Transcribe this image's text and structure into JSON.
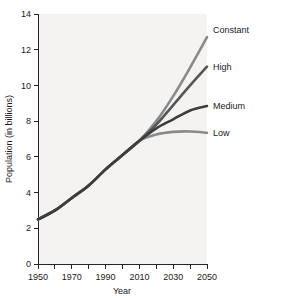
{
  "chart_data": {
    "type": "line",
    "title": "",
    "xlabel": "Year",
    "ylabel": "Population (in billions)",
    "xlim": [
      1950,
      2050
    ],
    "ylim": [
      0,
      14
    ],
    "grid": false,
    "legend_position": "right-inline",
    "x_ticks_major": [
      1950,
      1970,
      1990,
      2010,
      2030,
      2050
    ],
    "x_ticks_minor": [
      1960,
      1980,
      2000,
      2020,
      2040
    ],
    "x_tick_labels": [
      "1950",
      "1970",
      "1990",
      "2010",
      "2030",
      "2050"
    ],
    "y_ticks": [
      0,
      2,
      4,
      6,
      8,
      10,
      12,
      14
    ],
    "y_tick_labels": [
      "0",
      "2",
      "4",
      "6",
      "8",
      "10",
      "12",
      "14"
    ],
    "x": [
      1950,
      1960,
      1970,
      1980,
      1990,
      2000,
      2010,
      2020,
      2030,
      2040,
      2050
    ],
    "series": [
      {
        "name": "Constant",
        "label": "Constant",
        "color": "#8a8a8a",
        "values": [
          2.5,
          3.0,
          3.7,
          4.4,
          5.3,
          6.1,
          6.9,
          8.0,
          9.4,
          11.0,
          12.7
        ]
      },
      {
        "name": "High",
        "label": "High",
        "color": "#555555",
        "values": [
          2.5,
          3.0,
          3.7,
          4.4,
          5.3,
          6.1,
          6.9,
          7.8,
          8.9,
          10.0,
          11.05
        ]
      },
      {
        "name": "Medium",
        "label": "Medium",
        "color": "#3d3d3d",
        "values": [
          2.5,
          3.0,
          3.7,
          4.4,
          5.3,
          6.1,
          6.9,
          7.6,
          8.1,
          8.6,
          8.85
        ]
      },
      {
        "name": "Low",
        "label": "Low",
        "color": "#8a8a8a",
        "values": [
          2.5,
          3.0,
          3.7,
          4.4,
          5.3,
          6.1,
          6.9,
          7.25,
          7.4,
          7.42,
          7.35
        ]
      }
    ]
  }
}
